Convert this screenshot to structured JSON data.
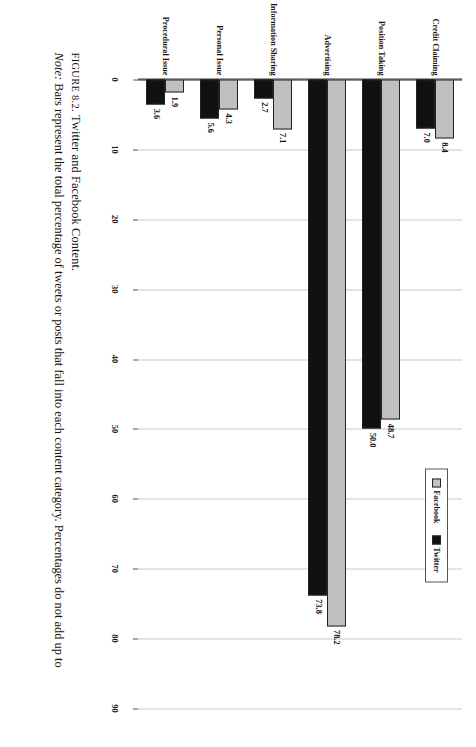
{
  "figure": {
    "number_label": "FIGURE 8.2.",
    "title": "Twitter and Facebook Content.",
    "note_prefix": "Note:",
    "note_text": " Bars represent the total percentage of tweets or posts that fall into each content category. Percentages do not add up to"
  },
  "legend": {
    "position": "top-right",
    "items": [
      {
        "label": "Facebook",
        "color": "#c0c0c0",
        "swatch": "legend-swatch-facebook"
      },
      {
        "label": "Twitter",
        "color": "#111111",
        "swatch": "legend-swatch-twitter"
      }
    ]
  },
  "chart_data": {
    "type": "bar",
    "title": "Twitter and Facebook Content.",
    "orientation": "vertical",
    "xlabel": "",
    "ylabel": "",
    "ylim": [
      0,
      90
    ],
    "yticks": [
      "0",
      "10",
      "20",
      "30",
      "40",
      "50",
      "60",
      "70",
      "80",
      "90"
    ],
    "grid": true,
    "legend_position": "top-right",
    "categories": [
      "Credit Claiming",
      "Position Taking",
      "Advertising",
      "Information Sharing",
      "Personal Issue",
      "Procedural Issue"
    ],
    "series": [
      {
        "name": "Facebook",
        "color": "#c0c0c0",
        "values": [
          8.4,
          48.7,
          78.2,
          7.1,
          4.3,
          1.9
        ],
        "labels": [
          "8.4",
          "48.7",
          "78.2",
          "7.1",
          "4.3",
          "1.9"
        ]
      },
      {
        "name": "Twitter",
        "color": "#111111",
        "values": [
          7.0,
          50.0,
          73.8,
          2.7,
          5.6,
          3.6
        ],
        "labels": [
          "7.0",
          "50.0",
          "73.8",
          "2.7",
          "5.6",
          "3.6"
        ]
      }
    ]
  }
}
